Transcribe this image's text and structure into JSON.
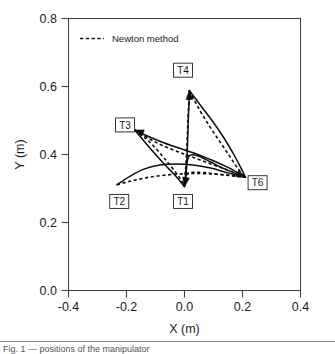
{
  "figure": {
    "background": "#ffffff",
    "axis_color": "#444444",
    "curve_color": "#0d0d0d"
  },
  "legend": {
    "position": "top-left-inside",
    "entries": [
      {
        "label": "Newton method",
        "style": "dashed"
      }
    ]
  },
  "caption": {
    "clipped_text": "Fig. 1 — positions of the manipulator"
  },
  "chart_data": {
    "type": "line",
    "title": "",
    "subtitle": "",
    "xlabel": "X (m)",
    "ylabel": "Y (m)",
    "xlim": [
      -0.4,
      0.4
    ],
    "ylim": [
      0.0,
      0.8
    ],
    "xticks": [
      -0.4,
      -0.2,
      0.0,
      0.2,
      0.4
    ],
    "yticks": [
      0.0,
      0.2,
      0.4,
      0.6,
      0.8
    ],
    "xtick_labels": [
      "-0.4",
      "-0.2",
      "0.0",
      "0.2",
      "0.4"
    ],
    "ytick_labels": [
      "0.0",
      "0.2",
      "0.4",
      "0.6",
      "0.8"
    ],
    "grid": false,
    "legend_position": "upper left",
    "annotations": [
      {
        "text": "T1",
        "x": -0.005,
        "y": 0.262,
        "boxed": true
      },
      {
        "text": "T2",
        "x": -0.225,
        "y": 0.262,
        "boxed": true
      },
      {
        "text": "T3",
        "x": -0.205,
        "y": 0.487,
        "boxed": true
      },
      {
        "text": "T4",
        "x": -0.005,
        "y": 0.648,
        "boxed": true
      },
      {
        "text": "T6",
        "x": 0.252,
        "y": 0.317,
        "boxed": true
      }
    ],
    "convergence_point": {
      "x": 0.21,
      "y": 0.333
    },
    "series": [
      {
        "name": "T1 reference (solid)",
        "style": "solid",
        "points": [
          [
            0.0,
            0.306
          ],
          [
            0.004,
            0.342
          ],
          [
            0.009,
            0.378
          ],
          [
            0.02,
            0.398
          ],
          [
            0.05,
            0.395
          ],
          [
            0.09,
            0.378
          ],
          [
            0.14,
            0.357
          ],
          [
            0.185,
            0.341
          ],
          [
            0.21,
            0.333
          ]
        ]
      },
      {
        "name": "T1 Newton method (dashed)",
        "style": "dashed",
        "points": [
          [
            0.0,
            0.306
          ],
          [
            0.006,
            0.33
          ],
          [
            0.012,
            0.345
          ],
          [
            0.04,
            0.348
          ],
          [
            0.085,
            0.345
          ],
          [
            0.135,
            0.34
          ],
          [
            0.18,
            0.336
          ],
          [
            0.21,
            0.333
          ]
        ]
      },
      {
        "name": "T2 reference (solid)",
        "style": "solid",
        "points": [
          [
            -0.233,
            0.311
          ],
          [
            -0.19,
            0.335
          ],
          [
            -0.14,
            0.357
          ],
          [
            -0.085,
            0.369
          ],
          [
            -0.03,
            0.372
          ],
          [
            0.03,
            0.369
          ],
          [
            0.09,
            0.36
          ],
          [
            0.15,
            0.346
          ],
          [
            0.21,
            0.333
          ]
        ]
      },
      {
        "name": "T2 Newton method (dashed)",
        "style": "dashed",
        "points": [
          [
            -0.233,
            0.311
          ],
          [
            -0.185,
            0.322
          ],
          [
            -0.13,
            0.332
          ],
          [
            -0.07,
            0.339
          ],
          [
            -0.01,
            0.343
          ],
          [
            0.05,
            0.344
          ],
          [
            0.11,
            0.342
          ],
          [
            0.165,
            0.338
          ],
          [
            0.21,
            0.333
          ]
        ]
      },
      {
        "name": "T3 reference (solid)",
        "style": "solid",
        "points": [
          [
            -0.172,
            0.472
          ],
          [
            -0.13,
            0.455
          ],
          [
            -0.085,
            0.439
          ],
          [
            -0.03,
            0.422
          ],
          [
            0.03,
            0.405
          ],
          [
            0.09,
            0.385
          ],
          [
            0.15,
            0.362
          ],
          [
            0.21,
            0.333
          ]
        ]
      },
      {
        "name": "T3 Newton method (dashed)",
        "style": "dashed",
        "points": [
          [
            -0.172,
            0.472
          ],
          [
            -0.125,
            0.448
          ],
          [
            -0.08,
            0.428
          ],
          [
            -0.025,
            0.409
          ],
          [
            0.035,
            0.39
          ],
          [
            0.095,
            0.371
          ],
          [
            0.155,
            0.352
          ],
          [
            0.21,
            0.333
          ]
        ]
      },
      {
        "name": "T3 branch reference (solid)",
        "style": "solid",
        "points": [
          [
            -0.172,
            0.472
          ],
          [
            -0.14,
            0.44
          ],
          [
            -0.105,
            0.405
          ],
          [
            -0.07,
            0.372
          ],
          [
            -0.035,
            0.341
          ],
          [
            -0.012,
            0.318
          ],
          [
            0.0,
            0.306
          ]
        ]
      },
      {
        "name": "T3 branch Newton method (dashed)",
        "style": "dashed",
        "points": [
          [
            -0.172,
            0.472
          ],
          [
            -0.132,
            0.446
          ],
          [
            -0.095,
            0.414
          ],
          [
            -0.06,
            0.379
          ],
          [
            -0.028,
            0.345
          ],
          [
            -0.008,
            0.32
          ],
          [
            0.0,
            0.306
          ]
        ]
      },
      {
        "name": "T4 reference (solid)",
        "style": "solid",
        "points": [
          [
            0.017,
            0.588
          ],
          [
            0.055,
            0.545
          ],
          [
            0.095,
            0.5
          ],
          [
            0.135,
            0.45
          ],
          [
            0.17,
            0.4
          ],
          [
            0.195,
            0.36
          ],
          [
            0.21,
            0.333
          ]
        ]
      },
      {
        "name": "T4 Newton method (dashed)",
        "style": "dashed",
        "points": [
          [
            0.017,
            0.588
          ],
          [
            0.05,
            0.534
          ],
          [
            0.085,
            0.485
          ],
          [
            0.12,
            0.44
          ],
          [
            0.155,
            0.396
          ],
          [
            0.185,
            0.358
          ],
          [
            0.21,
            0.333
          ]
        ]
      },
      {
        "name": "T4 stem reference (solid)",
        "style": "solid",
        "points": [
          [
            0.017,
            0.588
          ],
          [
            0.013,
            0.5
          ],
          [
            0.01,
            0.42
          ],
          [
            0.007,
            0.36
          ],
          [
            0.004,
            0.33
          ],
          [
            0.0,
            0.306
          ]
        ]
      },
      {
        "name": "T4 stem Newton method (dashed)",
        "style": "dashed",
        "points": [
          [
            0.017,
            0.588
          ],
          [
            0.012,
            0.5
          ],
          [
            0.008,
            0.42
          ],
          [
            0.004,
            0.36
          ],
          [
            0.0,
            0.33
          ],
          [
            -0.003,
            0.306
          ]
        ]
      }
    ],
    "arrow_tips": [
      {
        "x": 0.017,
        "y": 0.588,
        "direction": "up"
      },
      {
        "x": -0.172,
        "y": 0.472,
        "direction": "left-up"
      },
      {
        "x": 0.0,
        "y": 0.306,
        "direction": "down"
      },
      {
        "x": 0.21,
        "y": 0.333,
        "direction": "right-down"
      }
    ]
  }
}
